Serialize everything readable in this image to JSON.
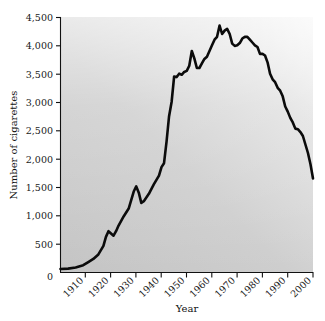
{
  "chart_data": {
    "type": "line",
    "title": "",
    "xlabel": "Year",
    "ylabel": "Number of cigarettes",
    "xlim": [
      1900,
      2000
    ],
    "ylim": [
      0,
      4500
    ],
    "grid": false,
    "legend": "none",
    "x_ticks": [
      1910,
      1920,
      1930,
      1940,
      1950,
      1960,
      1970,
      1980,
      1990,
      2000
    ],
    "x_tick_labels": [
      "1910",
      "1920",
      "1930",
      "1940",
      "1950",
      "1960",
      "1970",
      "1980",
      "1990",
      "2000"
    ],
    "y_ticks": [
      0,
      500,
      1000,
      1500,
      2000,
      2500,
      3000,
      3500,
      4000,
      4500
    ],
    "y_tick_labels": [
      "0",
      "500",
      "1,000",
      "1,500",
      "2,000",
      "2,500",
      "3,000",
      "3,500",
      "4,000",
      "4,500"
    ],
    "series": [
      {
        "name": "Number of cigarettes",
        "color": "#0b0b0b",
        "x": [
          1900,
          1903,
          1906,
          1909,
          1911,
          1913,
          1915,
          1917,
          1918,
          1919,
          1920,
          1921,
          1922,
          1923,
          1925,
          1927,
          1929,
          1930,
          1931,
          1932,
          1933,
          1935,
          1937,
          1939,
          1940,
          1941,
          1942,
          1943,
          1944,
          1945,
          1946,
          1947,
          1948,
          1949,
          1950,
          1951,
          1952,
          1953,
          1954,
          1955,
          1956,
          1957,
          1958,
          1959,
          1960,
          1961,
          1962,
          1963,
          1964,
          1965,
          1966,
          1967,
          1968,
          1969,
          1970,
          1971,
          1972,
          1973,
          1974,
          1975,
          1976,
          1977,
          1978,
          1979,
          1980,
          1981,
          1982,
          1983,
          1984,
          1985,
          1986,
          1987,
          1988,
          1989,
          1990,
          1991,
          1992,
          1993,
          1994,
          1995,
          1996,
          1997,
          1998,
          1999,
          2000
        ],
        "y": [
          54,
          60,
          80,
          120,
          175,
          230,
          310,
          460,
          620,
          720,
          680,
          640,
          720,
          820,
          980,
          1120,
          1420,
          1510,
          1400,
          1220,
          1250,
          1380,
          1550,
          1700,
          1850,
          1920,
          2300,
          2750,
          3000,
          3450,
          3440,
          3500,
          3480,
          3530,
          3550,
          3640,
          3900,
          3770,
          3600,
          3600,
          3680,
          3760,
          3800,
          3900,
          4000,
          4100,
          4150,
          4350,
          4200,
          4260,
          4290,
          4200,
          4030,
          3990,
          4000,
          4040,
          4120,
          4150,
          4150,
          4100,
          4050,
          4000,
          3970,
          3850,
          3850,
          3820,
          3700,
          3500,
          3400,
          3350,
          3250,
          3200,
          3100,
          2920,
          2830,
          2720,
          2640,
          2530,
          2520,
          2470,
          2400,
          2250,
          2100,
          1900,
          1650
        ]
      }
    ],
    "annotations": []
  },
  "style": {
    "line_color": "#0b0b0b",
    "axis_color": "#111111",
    "plot_bg_light": "#f2f2f2",
    "plot_bg_dark": "#c6c6c6",
    "page_bg": "#ffffff"
  }
}
